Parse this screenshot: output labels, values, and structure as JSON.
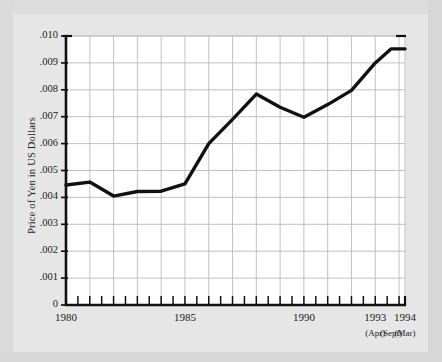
{
  "figure": {
    "background_color": "#e6e6e6",
    "plot_background_color": "#ffffff",
    "line_color": "#111111",
    "grid_color": "#b9b9c6",
    "axis_color": "#111111"
  },
  "chart_data": {
    "type": "line",
    "title": "",
    "xlabel": "",
    "ylabel": "Price of Yen in US Dollars",
    "ylim": [
      0,
      0.01
    ],
    "xlim": [
      1980,
      1994.25
    ],
    "grid": true,
    "legend": null,
    "ytick_labels": [
      ".010",
      ".009",
      ".008",
      ".007",
      ".006",
      ".005",
      ".004",
      ".003",
      ".002",
      ".001",
      "0"
    ],
    "ytick_values": [
      0.01,
      0.009,
      0.008,
      0.007,
      0.006,
      0.005,
      0.004,
      0.003,
      0.002,
      0.001,
      0
    ],
    "xtick_labels": [
      "1980",
      "1985",
      "1990",
      "1993",
      "1994"
    ],
    "xtick_values": [
      1980,
      1985,
      1990,
      1993,
      1994.25
    ],
    "xtick_sublabels": [
      "(Apr)",
      "(Sept)",
      "(Mar)"
    ],
    "xtick_sublabel_values": [
      1993,
      1993.66,
      1994.25
    ],
    "minor_xticks": [
      1980.5,
      1981,
      1981.5,
      1982,
      1982.5,
      1983,
      1983.5,
      1984,
      1984.5,
      1985,
      1985.5,
      1986,
      1986.5,
      1987,
      1987.5,
      1988,
      1988.5,
      1989,
      1989.5,
      1990,
      1990.5,
      1991,
      1991.5,
      1992,
      1992.5,
      1993,
      1993.5,
      1994
    ],
    "series": [
      {
        "name": "Price of Yen in US Dollars",
        "x": [
          1980,
          1981,
          1982,
          1983,
          1984,
          1985,
          1986,
          1987,
          1988,
          1989,
          1990,
          1991,
          1992,
          1993,
          1993.66,
          1994.25
        ],
        "values": [
          0.00446,
          0.00457,
          0.00405,
          0.00422,
          0.00423,
          0.0045,
          0.006,
          0.0069,
          0.00784,
          0.00735,
          0.00698,
          0.00745,
          0.00798,
          0.009,
          0.00952,
          0.00952
        ]
      }
    ]
  }
}
